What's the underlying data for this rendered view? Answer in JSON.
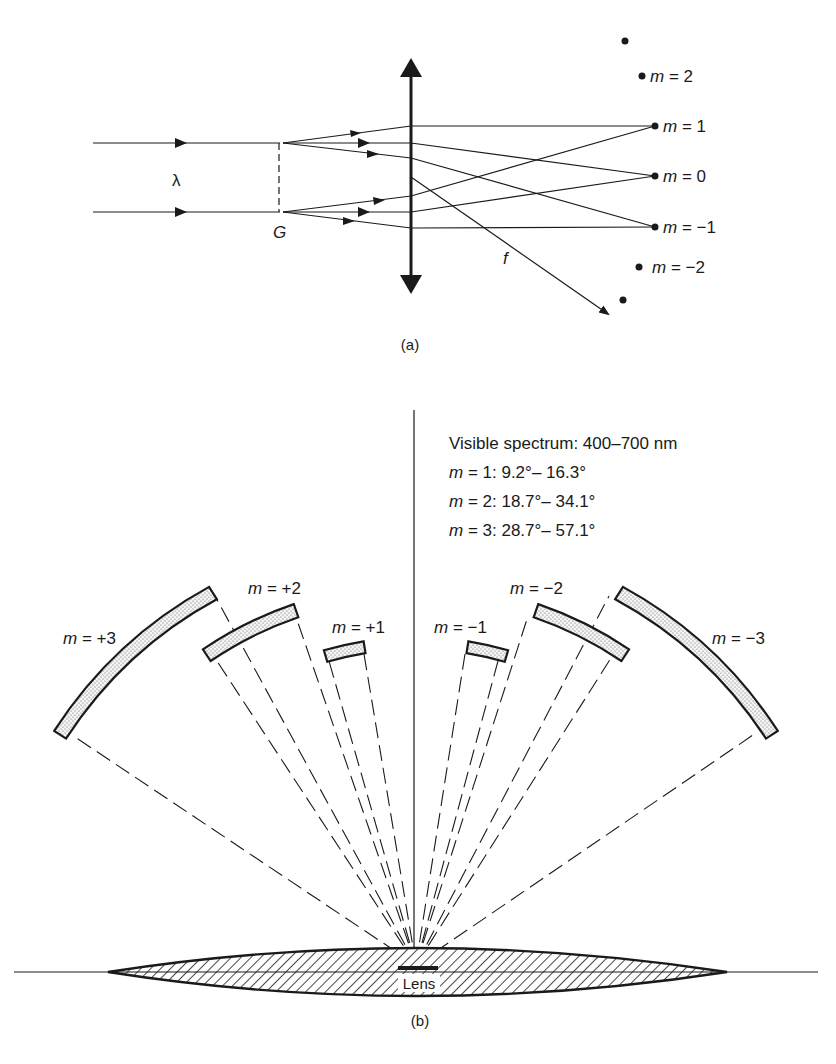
{
  "figure_a": {
    "caption": "(a)",
    "wavelength_label": "λ",
    "grating_label": "G",
    "focal_label": "f",
    "orders": [
      {
        "m": "2",
        "label": "m = 2"
      },
      {
        "m": "1",
        "label": "m = 1"
      },
      {
        "m": "0",
        "label": "m = 0"
      },
      {
        "m": "-1",
        "label": "m = −1"
      },
      {
        "m": "-2",
        "label": "m = −2"
      }
    ]
  },
  "figure_b": {
    "caption": "(b)",
    "lens_label": "Lens",
    "info": {
      "title": "Visible spectrum:  400–700 nm",
      "lines": [
        {
          "m": "m",
          "text": " = 1:  9.2°– 16.3°"
        },
        {
          "m": "m",
          "text": " = 2:  18.7°– 34.1°"
        },
        {
          "m": "m",
          "text": " = 3:  28.7°– 57.1°"
        }
      ]
    },
    "orders": [
      {
        "m": "+3",
        "label": "m = +3",
        "angle_range_deg": [
          28.7,
          57.1
        ]
      },
      {
        "m": "+2",
        "label": "m = +2",
        "angle_range_deg": [
          18.7,
          34.1
        ]
      },
      {
        "m": "+1",
        "label": "m = +1",
        "angle_range_deg": [
          9.2,
          16.3
        ]
      },
      {
        "m": "-1",
        "label": "m = −1",
        "angle_range_deg": [
          9.2,
          16.3
        ]
      },
      {
        "m": "-2",
        "label": "m = −2",
        "angle_range_deg": [
          18.7,
          34.1
        ]
      },
      {
        "m": "-3",
        "label": "m = −3",
        "angle_range_deg": [
          28.7,
          57.1
        ]
      }
    ]
  }
}
